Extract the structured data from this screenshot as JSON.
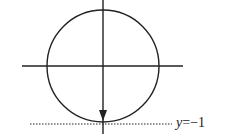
{
  "diagram": {
    "type": "unit-circle-with-downward-vector",
    "colors": {
      "stroke": "#222222",
      "background": "#ffffff"
    },
    "circle": {
      "cx": 103,
      "cy": 66,
      "r": 56
    },
    "horizontal_axis": {
      "x1": 22,
      "x2": 183,
      "y": 66
    },
    "vertical_axis": {
      "x": 103,
      "y1": 0,
      "y2": 134
    },
    "arrow": {
      "x": 103,
      "from_y": 66,
      "to_y": 119,
      "direction": "down"
    },
    "dotted_line": {
      "x1": 30,
      "x2": 172,
      "y": 124
    },
    "line_label": {
      "variable": "y",
      "equals": "=",
      "value": "−1"
    }
  }
}
